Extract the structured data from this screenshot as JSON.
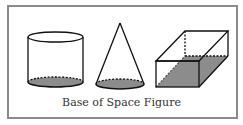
{
  "caption": "Base of Space Figure",
  "colors": {
    "border": "#8a8a8a",
    "stroke": "#111111",
    "base_fill": "#8c8c8c"
  },
  "figures": [
    {
      "name": "cylinder",
      "shaded_part": "circular base"
    },
    {
      "name": "cone",
      "shaded_part": "circular base"
    },
    {
      "name": "rectangular prism",
      "shaded_part": "rectangular base"
    }
  ]
}
